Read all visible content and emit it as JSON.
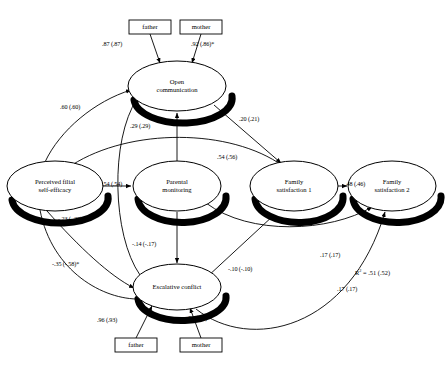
{
  "figure": {
    "type": "path-diagram",
    "background": "#ffffff",
    "stroke_color": "#000000",
    "shadow_color": "#000000"
  },
  "latent_nodes": [
    {
      "id": "open-communication",
      "label_line1": "Open",
      "label_line2": "communication",
      "cx": 177,
      "cy": 86,
      "rx": 49,
      "ry": 25
    },
    {
      "id": "perceived-filial-self-efficacy",
      "label_line1": "Perceived filial",
      "label_line2": "self-efficacy",
      "cx": 55,
      "cy": 186,
      "rx": 48,
      "ry": 25
    },
    {
      "id": "parental-monitoring",
      "label_line1": "Parental",
      "label_line2": "monitoring",
      "cx": 177,
      "cy": 186,
      "rx": 44,
      "ry": 25
    },
    {
      "id": "family-satisfaction-1",
      "label_line1": "Family",
      "label_line2": "satisfaction 1",
      "cx": 294,
      "cy": 186,
      "rx": 44,
      "ry": 25
    },
    {
      "id": "family-satisfaction-2",
      "label_line1": "Family",
      "label_line2": "satisfaction 2",
      "cx": 392,
      "cy": 186,
      "rx": 44,
      "ry": 25
    },
    {
      "id": "escalative-conflict",
      "label_line1": "Escalative conflict",
      "label_line2": "",
      "cx": 177,
      "cy": 287,
      "rx": 44,
      "ry": 23
    }
  ],
  "observed_nodes": [
    {
      "id": "father-top",
      "label": "father",
      "x": 129,
      "y": 20,
      "w": 42,
      "h": 14
    },
    {
      "id": "mother-top",
      "label": "mother",
      "x": 180,
      "y": 20,
      "w": 42,
      "h": 14
    },
    {
      "id": "father-bottom",
      "label": "father",
      "x": 115,
      "y": 338,
      "w": 42,
      "h": 14
    },
    {
      "id": "mother-bottom",
      "label": "mother",
      "x": 180,
      "y": 338,
      "w": 42,
      "h": 14
    }
  ],
  "coefficients": [
    {
      "id": "father-to-open-communication",
      "text": ".87 (.87)",
      "x": 102,
      "y": 40
    },
    {
      "id": "mother-to-open-communication",
      "text": ".92  (.86)*",
      "x": 191,
      "y": 40
    },
    {
      "id": "self-efficacy-to-open-communication",
      "text": ".60 (.60)",
      "x": 60,
      "y": 103
    },
    {
      "id": "escalative-conflict-to-open-communication",
      "text": ".29  (.29)",
      "x": 130,
      "y": 122
    },
    {
      "id": "open-communication-to-family-satisfaction-1",
      "text": ".20 (.21)",
      "x": 239,
      "y": 115
    },
    {
      "id": "parental-monitoring-to-family-satisfaction-1",
      "text": ".54 (.56)",
      "x": 217,
      "y": 153
    },
    {
      "id": "self-efficacy-to-parental-monitoring",
      "text": ".54 (.54)",
      "x": 102,
      "y": 180
    },
    {
      "id": "family-satisfaction-1-to-family-satisfaction-2",
      "text": ".48 (.46)",
      "x": 345,
      "y": 180
    },
    {
      "id": "self-efficacy-to-escalative-conflict-upper",
      "text": "-.23 (-.28)",
      "x": 58,
      "y": 215
    },
    {
      "id": "parental-monitoring-to-escalative-conflict",
      "text": "-.14 (-.17)",
      "x": 132,
      "y": 240
    },
    {
      "id": "escalative-conflict-to-family-satisfaction-1",
      "text": "-.10 (-.10)",
      "x": 228,
      "y": 265
    },
    {
      "id": "parental-monitoring-to-family-satisfaction-2",
      "text": ".17 (.17)",
      "x": 320,
      "y": 251
    },
    {
      "id": "self-efficacy-to-escalative-conflict-lower",
      "text": "-.35 (-.58)*",
      "x": 52,
      "y": 260
    },
    {
      "id": "escalative-conflict-to-family-satisfaction-2",
      "text": ".17 (.17)",
      "x": 337,
      "y": 285
    },
    {
      "id": "father-to-escalative-conflict",
      "text": ".96  (.93)",
      "x": 97,
      "y": 316
    },
    {
      "id": "mother-to-escalative-conflict",
      "text": ".93  (.88)*",
      "x": 187,
      "y": 314
    }
  ],
  "r_squared": {
    "id": "r-squared-annotation",
    "symbol": "R",
    "exponent": "2",
    "text": " = .51 (.52)",
    "x": 355,
    "y": 268
  }
}
